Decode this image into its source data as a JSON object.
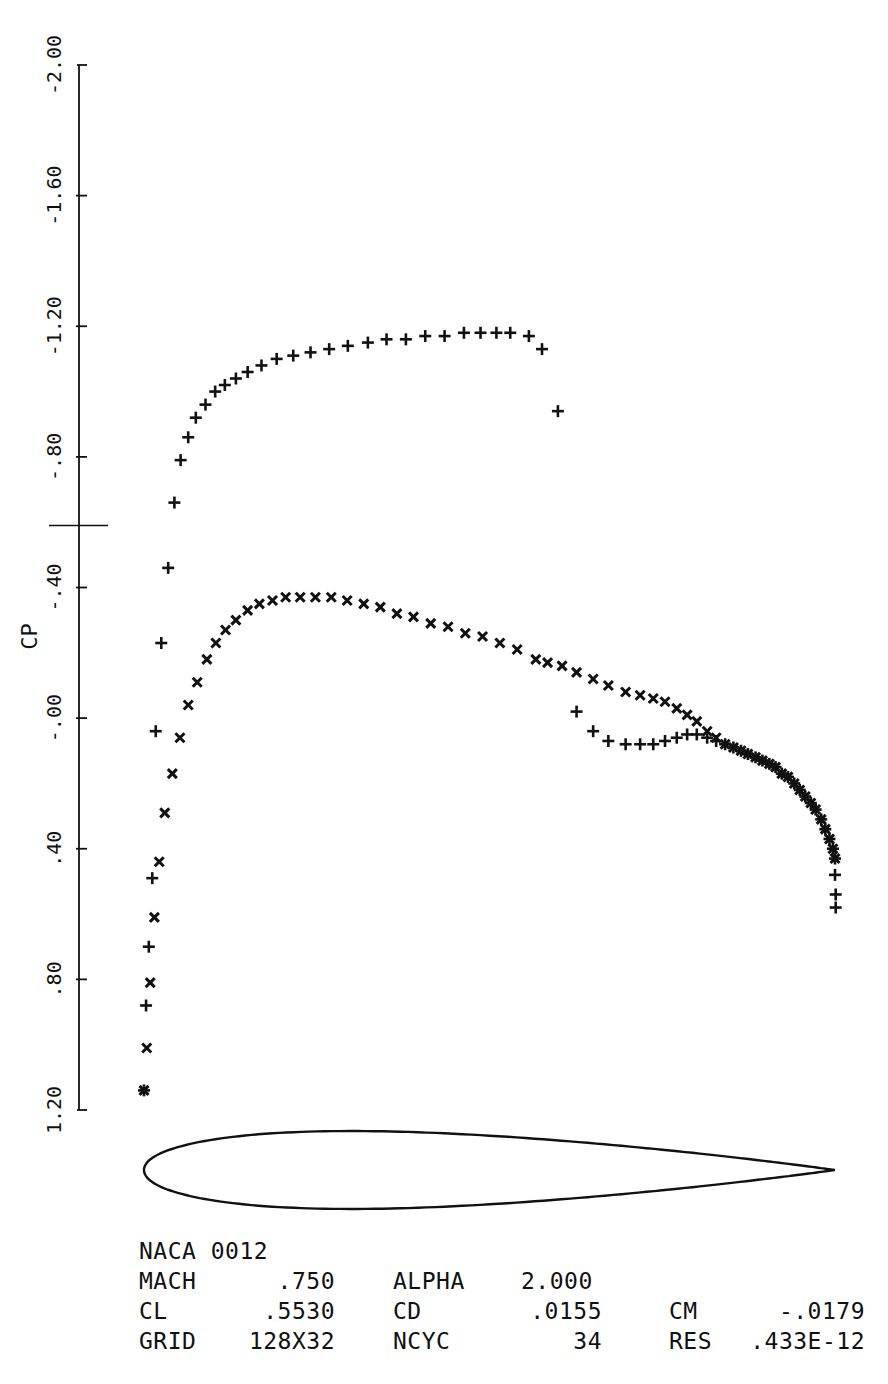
{
  "chart_data": {
    "type": "scatter",
    "title": "NACA 0012",
    "xlabel": "x/c",
    "ylabel": "CP",
    "ylim": [
      -2.0,
      1.2
    ],
    "y_inverted": true,
    "xlim": [
      0.0,
      1.0
    ],
    "grid": false,
    "legend": "none",
    "y_ticks": [
      -2.0,
      -1.6,
      -1.2,
      -0.8,
      -0.4,
      0.0,
      0.4,
      0.8,
      1.2
    ],
    "y_tick_labels": [
      "-2.00",
      "-1.60",
      "-1.20",
      "-.80",
      "-.40",
      "-.00",
      ".40",
      ".80",
      "1.20"
    ],
    "critical_cp_marker": -0.59,
    "series": [
      {
        "name": "upper surface (+)",
        "marker": "+",
        "x": [
          0.0,
          0.003,
          0.007,
          0.012,
          0.017,
          0.025,
          0.035,
          0.044,
          0.053,
          0.064,
          0.075,
          0.089,
          0.103,
          0.117,
          0.133,
          0.15,
          0.17,
          0.192,
          0.216,
          0.241,
          0.268,
          0.295,
          0.324,
          0.351,
          0.379,
          0.407,
          0.435,
          0.463,
          0.487,
          0.51,
          0.53,
          0.557,
          0.576,
          0.599,
          0.626,
          0.65,
          0.672,
          0.697,
          0.718,
          0.737,
          0.754,
          0.771,
          0.786,
          0.8,
          0.815,
          0.828,
          0.841,
          0.853,
          0.864,
          0.874,
          0.885,
          0.895,
          0.905,
          0.914,
          0.923,
          0.932,
          0.941,
          0.949,
          0.957,
          0.965,
          0.972,
          0.98,
          0.986,
          0.992,
          0.997,
          1.0,
          1.0,
          1.001,
          1.001
        ],
        "y": [
          1.14,
          0.88,
          0.7,
          0.49,
          0.04,
          -0.23,
          -0.46,
          -0.66,
          -0.79,
          -0.86,
          -0.92,
          -0.96,
          -1.0,
          -1.02,
          -1.04,
          -1.06,
          -1.08,
          -1.1,
          -1.11,
          -1.12,
          -1.13,
          -1.14,
          -1.15,
          -1.16,
          -1.16,
          -1.17,
          -1.17,
          -1.18,
          -1.18,
          -1.18,
          -1.18,
          -1.17,
          -1.13,
          -0.94,
          -0.02,
          0.04,
          0.07,
          0.08,
          0.08,
          0.08,
          0.07,
          0.06,
          0.05,
          0.05,
          0.06,
          0.07,
          0.08,
          0.09,
          0.1,
          0.11,
          0.12,
          0.13,
          0.14,
          0.15,
          0.17,
          0.18,
          0.2,
          0.22,
          0.24,
          0.26,
          0.28,
          0.31,
          0.34,
          0.37,
          0.4,
          0.43,
          0.48,
          0.54,
          0.58
        ]
      },
      {
        "name": "lower surface (x)",
        "marker": "x",
        "x": [
          0.0,
          0.004,
          0.009,
          0.015,
          0.022,
          0.03,
          0.041,
          0.052,
          0.064,
          0.077,
          0.091,
          0.104,
          0.118,
          0.133,
          0.15,
          0.167,
          0.186,
          0.205,
          0.226,
          0.248,
          0.271,
          0.294,
          0.318,
          0.342,
          0.366,
          0.39,
          0.415,
          0.44,
          0.465,
          0.49,
          0.515,
          0.54,
          0.567,
          0.584,
          0.605,
          0.626,
          0.65,
          0.672,
          0.697,
          0.718,
          0.737,
          0.754,
          0.771,
          0.786,
          0.8,
          0.815,
          0.828,
          0.841,
          0.853,
          0.864,
          0.874,
          0.885,
          0.895,
          0.905,
          0.914,
          0.923,
          0.932,
          0.941,
          0.949,
          0.957,
          0.965,
          0.972,
          0.98,
          0.986,
          0.992,
          0.997,
          1.0
        ],
        "y": [
          1.14,
          1.01,
          0.81,
          0.61,
          0.44,
          0.29,
          0.17,
          0.06,
          -0.04,
          -0.11,
          -0.18,
          -0.23,
          -0.27,
          -0.3,
          -0.33,
          -0.35,
          -0.36,
          -0.37,
          -0.37,
          -0.37,
          -0.37,
          -0.36,
          -0.35,
          -0.34,
          -0.32,
          -0.31,
          -0.29,
          -0.28,
          -0.26,
          -0.25,
          -0.23,
          -0.21,
          -0.18,
          -0.17,
          -0.16,
          -0.14,
          -0.12,
          -0.1,
          -0.08,
          -0.07,
          -0.06,
          -0.05,
          -0.03,
          -0.01,
          0.01,
          0.04,
          0.06,
          0.08,
          0.09,
          0.1,
          0.11,
          0.12,
          0.13,
          0.14,
          0.15,
          0.17,
          0.18,
          0.2,
          0.22,
          0.24,
          0.26,
          0.28,
          0.31,
          0.34,
          0.37,
          0.4,
          0.43
        ]
      }
    ],
    "annotations": [
      "NACA 0012"
    ]
  },
  "info": {
    "airfoil": "NACA 0012",
    "rows": [
      {
        "label1": "MACH",
        "value1": ".750",
        "label2": "ALPHA",
        "value2": "2.000",
        "label3": "",
        "value3": ""
      },
      {
        "label1": "CL",
        "value1": ".5530",
        "label2": "CD",
        "value2": ".0155",
        "label3": "CM",
        "value3": "-.0179"
      },
      {
        "label1": "GRID",
        "value1": "128X32",
        "label2": "NCYC",
        "value2": "34",
        "label3": "RES",
        "value3": ".433E-12"
      }
    ]
  },
  "colors": {
    "ink": "#111111",
    "background": "#ffffff"
  }
}
